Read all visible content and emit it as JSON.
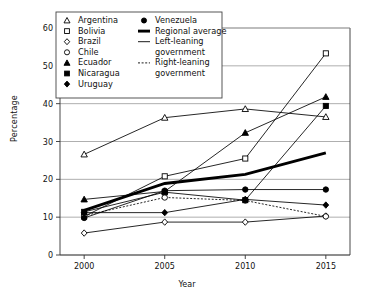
{
  "chart_data": {
    "type": "line",
    "title": "",
    "xlabel": "Year",
    "ylabel": "Percentage",
    "x": [
      2000,
      2005,
      2010,
      2015
    ],
    "xticklabels": [
      "2000",
      "2005",
      "2010",
      "2015"
    ],
    "yticklabels": [
      "0",
      "10",
      "20",
      "30",
      "40",
      "50",
      "60"
    ],
    "ylim": [
      0,
      60
    ],
    "xlim": [
      1998.5,
      2016.5
    ],
    "grid": "horizontal",
    "legend_position": "top-left-inside",
    "series": [
      {
        "name": "Argentina",
        "marker": "open-triangle",
        "line": "solid",
        "lean": "left",
        "values": [
          26.6,
          36.3,
          38.6,
          36.5
        ]
      },
      {
        "name": "Bolivia",
        "marker": "open-square",
        "line": "solid",
        "lean": "left",
        "values": [
          10.2,
          20.8,
          25.5,
          53.3
        ]
      },
      {
        "name": "Brazil",
        "marker": "open-diamond",
        "line": "solid",
        "lean": "left",
        "values": [
          5.8,
          8.7,
          8.7,
          10.3
        ]
      },
      {
        "name": "Chile",
        "marker": "open-circle",
        "line": "dotted",
        "lean": "right",
        "values": [
          10.4,
          15.2,
          14.4,
          10.2
        ]
      },
      {
        "name": "Ecuador",
        "marker": "filled-triangle",
        "line": "solid",
        "lean": "left",
        "values": [
          14.7,
          16.8,
          32.3,
          41.8
        ]
      },
      {
        "name": "Nicaragua",
        "marker": "filled-square",
        "line": "solid",
        "lean": "left",
        "values": [
          11.4,
          16.6,
          14.5,
          39.4
        ]
      },
      {
        "name": "Uruguay",
        "marker": "filled-diamond",
        "line": "solid",
        "lean": "left",
        "values": [
          11.2,
          11.2,
          14.7,
          13.2
        ]
      },
      {
        "name": "Venezuela",
        "marker": "filled-circle",
        "line": "solid",
        "lean": "left",
        "values": [
          9.8,
          17.0,
          17.3,
          17.3
        ]
      },
      {
        "name": "Regional average",
        "marker": "none",
        "line": "thick",
        "lean": "none",
        "values": [
          11.8,
          18.9,
          21.3,
          27.0
        ]
      }
    ],
    "legend": {
      "column1": [
        {
          "label": "Argentina",
          "marker": "open-triangle"
        },
        {
          "label": "Bolivia",
          "marker": "open-square"
        },
        {
          "label": "Brazil",
          "marker": "open-diamond"
        },
        {
          "label": "Chile",
          "marker": "open-circle"
        },
        {
          "label": "Ecuador",
          "marker": "filled-triangle"
        },
        {
          "label": "Nicaragua",
          "marker": "filled-square"
        },
        {
          "label": "Uruguay",
          "marker": "filled-diamond"
        }
      ],
      "column2": [
        {
          "label": "Venezuela",
          "marker": "filled-circle"
        },
        {
          "label": "Regional average",
          "marker": "thick-line"
        },
        {
          "label": "Left-leaning",
          "label2": "government",
          "marker": "thin-line"
        },
        {
          "label": "Right-leaning",
          "label2": "government",
          "marker": "dotted-line"
        }
      ]
    },
    "colors": {
      "line": "#000000",
      "grid": "#8c8c8c",
      "axis": "#333333",
      "background": "#ffffff"
    }
  }
}
